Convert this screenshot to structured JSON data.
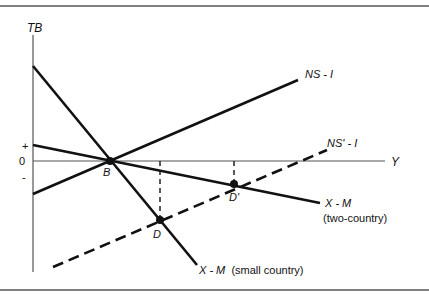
{
  "diagram": {
    "type": "economics-diagram",
    "axes": {
      "y_label": "TB",
      "x_label": "Y",
      "tick_plus": "+",
      "tick_zero": "0",
      "tick_minus": "-"
    },
    "points": {
      "B": "B",
      "D": "D",
      "D_prime": "D'"
    },
    "curves": {
      "ns_i": "NS - I",
      "ns_prime_i": "NS' - I",
      "xm_two_country_1": "X - M",
      "xm_two_country_2": "(two-country)",
      "xm_small_country": "X - M  (small country)"
    },
    "colors": {
      "line": "#111111",
      "axis": "#333333",
      "frame": "#555555"
    }
  }
}
